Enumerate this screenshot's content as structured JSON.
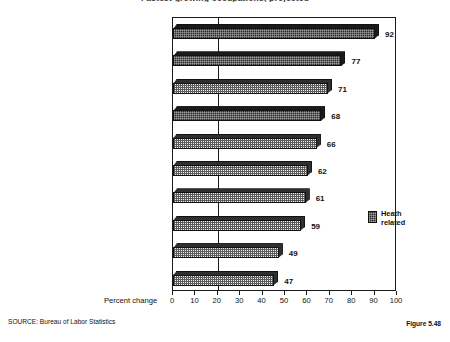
{
  "chart_data": {
    "type": "bar",
    "orientation": "horizontal",
    "title": "Fastest growing occupations, projected",
    "categories": [
      "Home health aides",
      "Personal home care aides",
      "Human services workers",
      "Medical secretaries",
      "Subway and streetcar operators",
      "Travel agents",
      "Correction officers",
      "Flight attendants",
      "Child care workers",
      "Receptionists and information clerks"
    ],
    "values": [
      92,
      77,
      71,
      68,
      66,
      62,
      61,
      59,
      49,
      47
    ],
    "health_related": [
      true,
      true,
      false,
      true,
      false,
      false,
      false,
      false,
      false,
      false
    ],
    "xlabel": "Percent change",
    "ylabel": "",
    "xlim": [
      0,
      100
    ],
    "xticks": [
      0,
      10,
      20,
      30,
      40,
      50,
      60,
      70,
      80,
      90,
      100
    ],
    "reference_line": 20,
    "grid": false,
    "legend": {
      "position": "inside-right",
      "entries": [
        {
          "label_line1": "Heath",
          "label_line2": "related",
          "color": "#2b2b2b"
        }
      ]
    }
  },
  "footer": {
    "source": "SOURCE:  Bureau of Labor Statistics",
    "figure_number": "Figure 5.48"
  },
  "colors": {
    "health_fill": "#2b2b2b",
    "other_fill": "#f2f2f2",
    "axis": "#1b1b1b",
    "text": "#111111"
  }
}
